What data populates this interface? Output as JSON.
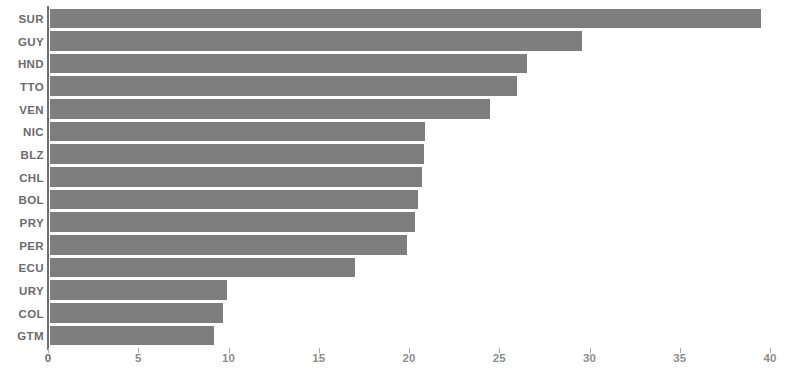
{
  "chart_data": {
    "type": "bar",
    "orientation": "horizontal",
    "title": "",
    "subtitle": "",
    "xlabel": "",
    "ylabel": "",
    "categories": [
      "SUR",
      "GUY",
      "HND",
      "TTO",
      "VEN",
      "NIC",
      "BLZ",
      "CHL",
      "BOL",
      "PRY",
      "PER",
      "ECU",
      "URY",
      "COL",
      "GTM"
    ],
    "values": [
      39.4,
      29.5,
      26.4,
      25.9,
      24.4,
      20.8,
      20.7,
      20.6,
      20.4,
      20.2,
      19.8,
      16.9,
      9.8,
      9.6,
      9.1
    ],
    "xlim": [
      0,
      40
    ],
    "xticks": [
      0,
      5,
      10,
      15,
      20,
      25,
      30,
      35,
      40
    ],
    "xtick_labels": [
      "0",
      "5",
      "10",
      "15",
      "20",
      "25",
      "30",
      "35",
      "40"
    ],
    "grid": false,
    "legend": false,
    "legend_position": "none",
    "bar_color": "#7e7e7e",
    "axis_color": "#6f6f6f",
    "label_color": "#6b6b6b",
    "tick_color": "#8d8d8d",
    "background_color": "#ffffff"
  }
}
